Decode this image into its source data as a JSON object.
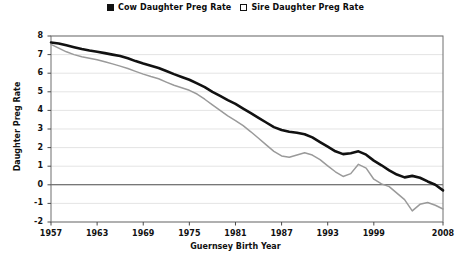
{
  "legend": {
    "position": "top-center",
    "items": [
      {
        "label": "Cow Daughter Preg Rate",
        "marker": "filled-square",
        "color": "#111111"
      },
      {
        "label": "Sire Daughter Preg Rate",
        "marker": "open-square",
        "color": "#9a9a9a"
      }
    ]
  },
  "axes": {
    "xlabel": "Guernsey Birth Year",
    "ylabel": "Daughter Preg Rate",
    "yticks": [
      "8",
      "7",
      "6",
      "5",
      "4",
      "3",
      "2",
      "1",
      "0",
      "-1",
      "-2"
    ],
    "xticks": [
      "1957",
      "1963",
      "1969",
      "1975",
      "1981",
      "1987",
      "1993",
      "1999",
      "2008"
    ]
  },
  "chart_data": {
    "type": "line",
    "title": "",
    "subtitle": "",
    "xlabel": "Guernsey Birth Year",
    "ylabel": "Daughter Preg Rate",
    "xlim": [
      1957,
      2008
    ],
    "ylim": [
      -2,
      8
    ],
    "grid": true,
    "grid_axis": "y",
    "zero_line": true,
    "legend_position": "top-center",
    "annotations": [],
    "x": [
      1957,
      1958,
      1959,
      1960,
      1961,
      1962,
      1963,
      1964,
      1965,
      1966,
      1967,
      1968,
      1969,
      1970,
      1971,
      1972,
      1973,
      1974,
      1975,
      1976,
      1977,
      1978,
      1979,
      1980,
      1981,
      1982,
      1983,
      1984,
      1985,
      1986,
      1987,
      1988,
      1989,
      1990,
      1991,
      1992,
      1993,
      1994,
      1995,
      1996,
      1997,
      1998,
      1999,
      2000,
      2001,
      2002,
      2003,
      2004,
      2005,
      2006,
      2007,
      2008
    ],
    "series": [
      {
        "name": "Cow Daughter Preg Rate",
        "color": "#111111",
        "marker": "filled-square",
        "values": [
          7.65,
          7.6,
          7.5,
          7.4,
          7.3,
          7.22,
          7.15,
          7.08,
          7.0,
          6.92,
          6.8,
          6.65,
          6.52,
          6.4,
          6.28,
          6.12,
          5.95,
          5.8,
          5.65,
          5.45,
          5.25,
          5.0,
          4.78,
          4.55,
          4.35,
          4.1,
          3.85,
          3.6,
          3.35,
          3.1,
          2.95,
          2.85,
          2.8,
          2.72,
          2.55,
          2.3,
          2.05,
          1.8,
          1.65,
          1.7,
          1.8,
          1.62,
          1.3,
          1.05,
          0.78,
          0.55,
          0.4,
          0.48,
          0.38,
          0.18,
          0.0,
          -0.3
        ]
      },
      {
        "name": "Sire Daughter Preg Rate",
        "color": "#9a9a9a",
        "marker": "open-square",
        "values": [
          7.55,
          7.35,
          7.15,
          7.0,
          6.88,
          6.8,
          6.72,
          6.62,
          6.5,
          6.38,
          6.25,
          6.1,
          5.95,
          5.82,
          5.7,
          5.52,
          5.35,
          5.22,
          5.08,
          4.88,
          4.6,
          4.3,
          4.0,
          3.7,
          3.45,
          3.18,
          2.85,
          2.5,
          2.15,
          1.8,
          1.55,
          1.48,
          1.6,
          1.72,
          1.6,
          1.35,
          1.02,
          0.7,
          0.45,
          0.6,
          1.1,
          0.9,
          0.3,
          0.05,
          -0.1,
          -0.45,
          -0.8,
          -1.4,
          -1.05,
          -0.95,
          -1.1,
          -1.3
        ]
      }
    ]
  }
}
